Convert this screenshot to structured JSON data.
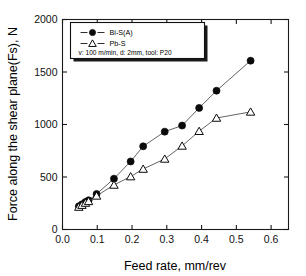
{
  "chart_data": {
    "type": "scatter",
    "title": "",
    "xlabel": "Feed rate, mm/rev",
    "ylabel": "Force along the shear plane(Fs), N",
    "xlim": [
      0.0,
      0.65
    ],
    "ylim": [
      0,
      2000
    ],
    "xticks": [
      "0.0",
      "0.1",
      "0.2",
      "0.3",
      "0.4",
      "0.5",
      "0.6"
    ],
    "xtick_values": [
      0.0,
      0.1,
      0.2,
      0.3,
      0.4,
      0.5,
      0.6
    ],
    "yticks": [
      "0",
      "500",
      "1000",
      "1500",
      "2000"
    ],
    "ytick_values": [
      0,
      500,
      1000,
      1500,
      2000
    ],
    "grid": false,
    "legend_position": "upper-left",
    "series": [
      {
        "name": "Bi-S(A)",
        "marker": "filled-circle",
        "x": [
          0.047,
          0.056,
          0.066,
          0.075,
          0.098,
          0.148,
          0.196,
          0.232,
          0.294,
          0.344,
          0.393,
          0.443,
          0.541
        ],
        "values": [
          222,
          240,
          262,
          278,
          338,
          484,
          648,
          792,
          932,
          990,
          1158,
          1322,
          1608
        ]
      },
      {
        "name": "Pb-S",
        "marker": "open-triangle",
        "x": [
          0.047,
          0.056,
          0.066,
          0.075,
          0.098,
          0.148,
          0.196,
          0.232,
          0.294,
          0.344,
          0.393,
          0.443,
          0.541
        ],
        "values": [
          214,
          232,
          252,
          268,
          320,
          424,
          504,
          576,
          672,
          796,
          936,
          1062,
          1120
        ]
      }
    ],
    "annotations": [
      "v: 100 m/min, d: 2mm, tool: P20"
    ]
  },
  "legend": {
    "entries": [
      {
        "label": "Bi-S(A)",
        "marker": "filled-circle"
      },
      {
        "label": "Pb-S",
        "marker": "open-triangle"
      }
    ],
    "conditions": "v: 100 m/min, d: 2mm, tool: P20"
  },
  "axes": {
    "x_title": "Feed rate, mm/rev",
    "y_title": "Force along the shear plane(Fs), N",
    "x_tick_labels": [
      "0.0",
      "0.1",
      "0.2",
      "0.3",
      "0.4",
      "0.5",
      "0.6"
    ],
    "y_tick_labels": [
      "0",
      "500",
      "1000",
      "1500",
      "2000"
    ]
  },
  "colors": {
    "marker_fill": "#0a0a0a",
    "marker_open_fill": "#ffffff",
    "line": "#3c3c3c",
    "axis": "#1a1a1a",
    "background": "#ffffff"
  }
}
